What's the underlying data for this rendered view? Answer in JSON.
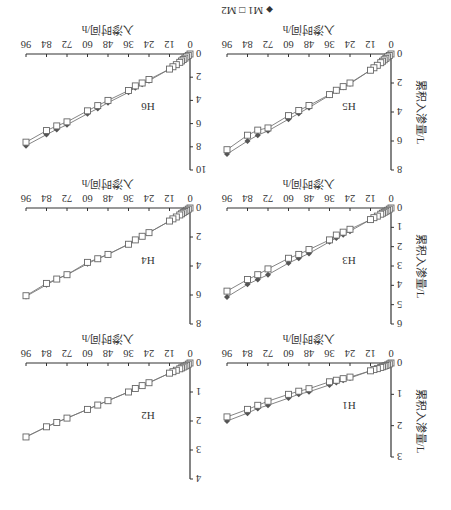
{
  "legend": {
    "m1_label": "M1",
    "m2_label": "M2",
    "m1_marker": "diamond-filled",
    "m2_marker": "square-open"
  },
  "axes_text": {
    "xlabel": "入渗时间/h",
    "ylabel": "累积入渗量/L"
  },
  "colors": {
    "m1": "#555555",
    "m2": "#666666",
    "axis": "#333333",
    "line": "#777777"
  },
  "chart_data": [
    {
      "type": "line",
      "title": "H1",
      "xlabel": "入渗时间/h",
      "ylabel": "累积入渗量/L",
      "xticks": [
        0,
        12,
        24,
        36,
        48,
        60,
        72,
        84,
        96
      ],
      "xlim": [
        0,
        96
      ],
      "yticks": [
        0,
        1,
        2,
        3
      ],
      "ylim": [
        0,
        3
      ],
      "x": [
        0,
        1,
        2,
        3,
        4,
        5,
        6,
        8,
        10,
        12,
        24,
        28,
        32,
        36,
        48,
        54,
        60,
        72,
        78,
        84,
        96
      ],
      "series": [
        {
          "name": "M1",
          "values": [
            0,
            0.03,
            0.06,
            0.08,
            0.1,
            0.12,
            0.14,
            0.18,
            0.21,
            0.25,
            0.48,
            0.55,
            0.62,
            0.7,
            0.92,
            1.0,
            1.12,
            1.35,
            1.45,
            1.6,
            1.85
          ]
        },
        {
          "name": "M2",
          "values": [
            0,
            0.03,
            0.06,
            0.08,
            0.1,
            0.12,
            0.14,
            0.18,
            0.21,
            0.25,
            0.45,
            0.5,
            0.55,
            0.6,
            0.82,
            0.9,
            1.0,
            1.22,
            1.35,
            1.48,
            1.72
          ]
        }
      ]
    },
    {
      "type": "line",
      "title": "H2",
      "xlabel": "入渗时间/h",
      "ylabel": "累积入渗量/L",
      "xticks": [
        0,
        12,
        24,
        36,
        48,
        60,
        72,
        84,
        96
      ],
      "xlim": [
        0,
        96
      ],
      "yticks": [
        0,
        1,
        2,
        3,
        4
      ],
      "ylim": [
        0,
        4
      ],
      "x": [
        0,
        1,
        2,
        3,
        4,
        5,
        6,
        8,
        10,
        12,
        24,
        28,
        32,
        36,
        48,
        54,
        60,
        72,
        78,
        84,
        96
      ],
      "series": [
        {
          "name": "M1",
          "values": [
            0,
            0.04,
            0.08,
            0.11,
            0.14,
            0.17,
            0.2,
            0.25,
            0.3,
            0.35,
            0.68,
            0.78,
            0.88,
            1.0,
            1.3,
            1.45,
            1.6,
            1.9,
            2.05,
            2.2,
            2.55
          ]
        },
        {
          "name": "M2",
          "values": [
            0,
            0.04,
            0.08,
            0.11,
            0.14,
            0.17,
            0.2,
            0.25,
            0.3,
            0.35,
            0.68,
            0.78,
            0.88,
            1.0,
            1.3,
            1.45,
            1.6,
            1.9,
            2.05,
            2.2,
            2.55
          ]
        }
      ]
    },
    {
      "type": "line",
      "title": "H3",
      "xlabel": "入渗时间/h",
      "ylabel": "累积入渗量/L",
      "xticks": [
        0,
        12,
        24,
        36,
        48,
        60,
        72,
        84,
        96
      ],
      "xlim": [
        0,
        96
      ],
      "yticks": [
        0,
        1,
        2,
        3,
        4,
        5,
        6
      ],
      "ylim": [
        0,
        6
      ],
      "x": [
        0,
        1,
        2,
        3,
        4,
        5,
        6,
        8,
        10,
        12,
        24,
        28,
        32,
        36,
        48,
        54,
        60,
        72,
        78,
        84,
        96
      ],
      "series": [
        {
          "name": "M1",
          "values": [
            0,
            0.06,
            0.12,
            0.17,
            0.22,
            0.27,
            0.32,
            0.42,
            0.5,
            0.6,
            1.2,
            1.38,
            1.55,
            1.75,
            2.35,
            2.6,
            2.85,
            3.45,
            3.7,
            3.95,
            4.6
          ]
        },
        {
          "name": "M2",
          "values": [
            0,
            0.06,
            0.12,
            0.17,
            0.22,
            0.27,
            0.32,
            0.42,
            0.5,
            0.6,
            1.1,
            1.25,
            1.4,
            1.65,
            2.15,
            2.4,
            2.6,
            3.15,
            3.45,
            3.7,
            4.3
          ]
        }
      ]
    },
    {
      "type": "line",
      "title": "H4",
      "xlabel": "入渗时间/h",
      "ylabel": "累积入渗量/L",
      "xticks": [
        0,
        12,
        24,
        36,
        48,
        60,
        72,
        84,
        96
      ],
      "xlim": [
        0,
        96
      ],
      "yticks": [
        0,
        2,
        4,
        6,
        8
      ],
      "ylim": [
        0,
        8
      ],
      "x": [
        0,
        1,
        2,
        3,
        4,
        5,
        6,
        8,
        10,
        12,
        24,
        28,
        32,
        36,
        48,
        54,
        60,
        72,
        78,
        84,
        96
      ],
      "series": [
        {
          "name": "M1",
          "values": [
            0,
            0.08,
            0.16,
            0.24,
            0.32,
            0.4,
            0.48,
            0.62,
            0.75,
            0.9,
            1.7,
            1.95,
            2.2,
            2.5,
            3.2,
            3.5,
            3.85,
            4.6,
            4.9,
            5.3,
            6.1
          ]
        },
        {
          "name": "M2",
          "values": [
            0,
            0.08,
            0.16,
            0.24,
            0.32,
            0.4,
            0.48,
            0.62,
            0.75,
            0.9,
            1.7,
            1.95,
            2.2,
            2.5,
            3.2,
            3.5,
            3.75,
            4.6,
            4.9,
            5.2,
            6.05
          ]
        }
      ]
    },
    {
      "type": "line",
      "title": "H5",
      "xlabel": "入渗时间/h",
      "ylabel": "累积入渗量/L",
      "xticks": [
        0,
        12,
        24,
        36,
        48,
        60,
        72,
        84,
        96
      ],
      "xlim": [
        0,
        96
      ],
      "yticks": [
        0,
        2,
        4,
        6,
        8
      ],
      "ylim": [
        0,
        8
      ],
      "x": [
        0,
        1,
        2,
        3,
        4,
        5,
        6,
        8,
        10,
        12,
        24,
        28,
        32,
        36,
        48,
        54,
        60,
        72,
        78,
        84,
        96
      ],
      "series": [
        {
          "name": "M1",
          "values": [
            0,
            0.1,
            0.2,
            0.3,
            0.4,
            0.5,
            0.6,
            0.78,
            0.95,
            1.12,
            2.05,
            2.3,
            2.55,
            2.85,
            3.7,
            4.1,
            4.5,
            5.3,
            5.6,
            6.0,
            6.9
          ]
        },
        {
          "name": "M2",
          "values": [
            0,
            0.1,
            0.2,
            0.3,
            0.4,
            0.5,
            0.6,
            0.78,
            0.95,
            1.12,
            2.0,
            2.25,
            2.5,
            2.8,
            3.55,
            3.9,
            4.25,
            5.1,
            5.25,
            5.6,
            6.6
          ]
        }
      ]
    },
    {
      "type": "line",
      "title": "H6",
      "xlabel": "入渗时间/h",
      "ylabel": "累积入渗量/L",
      "xticks": [
        0,
        12,
        24,
        36,
        48,
        60,
        72,
        84,
        96
      ],
      "xlim": [
        0,
        96
      ],
      "yticks": [
        0,
        2,
        4,
        6,
        8,
        10
      ],
      "ylim": [
        0,
        10
      ],
      "x": [
        0,
        1,
        2,
        3,
        4,
        5,
        6,
        8,
        10,
        12,
        24,
        28,
        32,
        36,
        48,
        54,
        60,
        72,
        78,
        84,
        96
      ],
      "series": [
        {
          "name": "M1",
          "values": [
            0,
            0.12,
            0.24,
            0.36,
            0.48,
            0.6,
            0.72,
            0.92,
            1.1,
            1.3,
            2.3,
            2.6,
            2.9,
            3.3,
            4.2,
            4.7,
            5.15,
            6.1,
            6.5,
            6.95,
            7.9
          ]
        },
        {
          "name": "M2",
          "values": [
            0,
            0.12,
            0.24,
            0.36,
            0.48,
            0.6,
            0.72,
            0.92,
            1.1,
            1.3,
            2.2,
            2.5,
            2.75,
            3.15,
            4.0,
            4.45,
            4.9,
            5.85,
            6.2,
            6.6,
            7.6
          ]
        }
      ]
    }
  ]
}
